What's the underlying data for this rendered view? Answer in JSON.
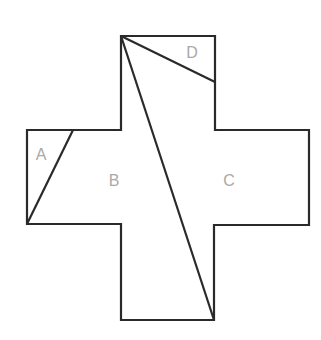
{
  "diagram": {
    "shape": "cross",
    "stroke_color": "#2a2a2a",
    "label_color": "#a9a9a9",
    "regions": [
      {
        "id": "A",
        "label": "A",
        "x": 41,
        "y": 160
      },
      {
        "id": "B",
        "label": "B",
        "x": 114,
        "y": 186
      },
      {
        "id": "C",
        "label": "C",
        "x": 229,
        "y": 186
      },
      {
        "id": "D",
        "label": "D",
        "x": 192,
        "y": 58
      }
    ]
  }
}
